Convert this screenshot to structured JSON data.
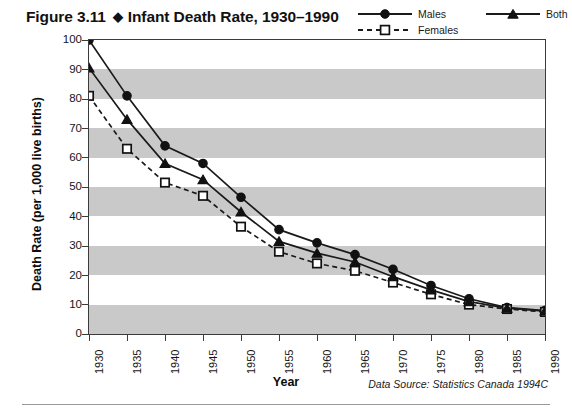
{
  "figure": {
    "label": "Figure 3.11",
    "separator": "◆",
    "title": "Infant Death Rate, 1930–1990"
  },
  "legend": {
    "position": "top-right",
    "entries": [
      {
        "name": "Males",
        "marker": "filled-circle",
        "line": "solid"
      },
      {
        "name": "Females",
        "marker": "open-square",
        "line": "dashed"
      },
      {
        "name": "Both",
        "marker": "filled-triangle",
        "line": "solid"
      }
    ]
  },
  "source_note": "Data Source: Statistics Canada 1994C",
  "axes": {
    "xlabel": "Year",
    "ylabel": "Death Rate (per 1,000 live births)",
    "yticks": [
      "0",
      "10",
      "20",
      "30",
      "40",
      "50",
      "60",
      "70",
      "80",
      "90",
      "100"
    ],
    "xticks": [
      "1930",
      "1935",
      "1940",
      "1945",
      "1950",
      "1955",
      "1960",
      "1965",
      "1970",
      "1975",
      "1980",
      "1985",
      "1990"
    ]
  },
  "colors": {
    "band": "#c9c9c9",
    "frame": "#3b3b3b",
    "line": "#1a1a1a",
    "background": "#ffffff"
  },
  "chart_data": {
    "type": "line",
    "title": "Infant Death Rate, 1930–1990",
    "xlabel": "Year",
    "ylabel": "Death Rate (per 1,000 live births)",
    "xlim": [
      1930,
      1990
    ],
    "ylim": [
      0,
      100
    ],
    "ytick_step": 10,
    "xtick_step": 5,
    "grid": "horizontal alternating gray bands every 10 units",
    "legend_position": "top-right",
    "annotations": [
      "Data Source: Statistics Canada 1994C"
    ],
    "x": [
      1930,
      1935,
      1940,
      1945,
      1950,
      1955,
      1960,
      1965,
      1970,
      1975,
      1980,
      1985,
      1990
    ],
    "series": [
      {
        "name": "Males",
        "marker": "filled-circle",
        "line": "solid",
        "values": [
          100,
          81,
          64,
          58,
          46.5,
          35.5,
          31,
          27,
          22,
          16.5,
          12,
          9,
          8
        ]
      },
      {
        "name": "Females",
        "marker": "open-square",
        "line": "dashed",
        "values": [
          81,
          63,
          51.5,
          47,
          36.5,
          28,
          24,
          21.5,
          17.5,
          13.5,
          10,
          8.5,
          7.5
        ]
      },
      {
        "name": "Both",
        "marker": "filled-triangle",
        "line": "solid",
        "values": [
          90.5,
          73,
          58,
          52.5,
          41.5,
          31.5,
          27.5,
          24.5,
          19.5,
          15,
          11,
          8.8,
          7.8
        ]
      }
    ]
  }
}
